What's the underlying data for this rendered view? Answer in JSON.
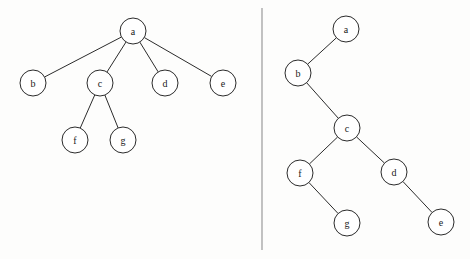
{
  "figure": {
    "background_color": "#fdfdfc",
    "stroke_color": "#2b2b2b",
    "node_fill_color": "#ffffff",
    "label_color": "#1a1a1a",
    "divider_color": "#9a9a9a",
    "node_radius": 13,
    "width": 470,
    "height": 259
  },
  "divider": {
    "x": 262,
    "y1": 8,
    "y2": 250
  },
  "panels": [
    {
      "name": "general-tree",
      "nodes": [
        {
          "id": "a",
          "label": "a",
          "cx": 133,
          "cy": 31
        },
        {
          "id": "b",
          "label": "b",
          "cx": 33,
          "cy": 83
        },
        {
          "id": "c",
          "label": "c",
          "cx": 100,
          "cy": 83
        },
        {
          "id": "d",
          "label": "d",
          "cx": 165,
          "cy": 83
        },
        {
          "id": "e",
          "label": "e",
          "cx": 223,
          "cy": 83
        },
        {
          "id": "f",
          "label": "f",
          "cx": 75,
          "cy": 140
        },
        {
          "id": "g",
          "label": "g",
          "cx": 123,
          "cy": 140
        }
      ],
      "edges": [
        {
          "from": "a",
          "to": "b"
        },
        {
          "from": "a",
          "to": "c"
        },
        {
          "from": "a",
          "to": "d"
        },
        {
          "from": "a",
          "to": "e"
        },
        {
          "from": "c",
          "to": "f"
        },
        {
          "from": "c",
          "to": "g"
        }
      ]
    },
    {
      "name": "binary-tree",
      "nodes": [
        {
          "id": "a",
          "label": "a",
          "cx": 346,
          "cy": 29
        },
        {
          "id": "b",
          "label": "b",
          "cx": 298,
          "cy": 73
        },
        {
          "id": "c",
          "label": "c",
          "cx": 347,
          "cy": 128
        },
        {
          "id": "f",
          "label": "f",
          "cx": 300,
          "cy": 173
        },
        {
          "id": "d",
          "label": "d",
          "cx": 394,
          "cy": 172
        },
        {
          "id": "g",
          "label": "g",
          "cx": 347,
          "cy": 223
        },
        {
          "id": "e",
          "label": "e",
          "cx": 441,
          "cy": 222
        }
      ],
      "edges": [
        {
          "from": "a",
          "to": "b"
        },
        {
          "from": "b",
          "to": "c"
        },
        {
          "from": "c",
          "to": "f"
        },
        {
          "from": "c",
          "to": "d"
        },
        {
          "from": "f",
          "to": "g"
        },
        {
          "from": "d",
          "to": "e"
        }
      ]
    }
  ]
}
